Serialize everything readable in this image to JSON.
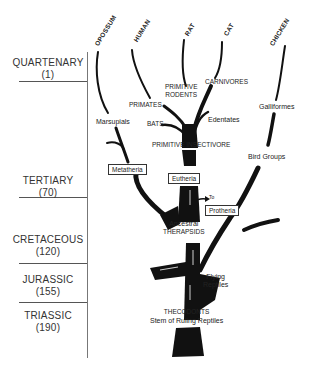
{
  "species": [
    {
      "label": "OPOSSUM"
    },
    {
      "label": "HUMAN"
    },
    {
      "label": "RAT"
    },
    {
      "label": "CAT"
    },
    {
      "label": "CHICKEN"
    }
  ],
  "eras": [
    {
      "name": "QUARTENARY",
      "age": "(1)"
    },
    {
      "name": "TERTIARY",
      "age": "(70)"
    },
    {
      "name": "CRETACEOUS",
      "age": "(120)"
    },
    {
      "name": "JURASSIC",
      "age": "(155)"
    },
    {
      "name": "TRIASSIC",
      "age": "(190)"
    }
  ],
  "labels": {
    "marsupials": "Marsupials",
    "primates": "PRIMATES",
    "primitive_rodents_1": "PRIMITIVE",
    "primitive_rodents_2": "RODENTS",
    "carnivores": "CARNIVORES",
    "bats": "BATS",
    "edentates": "Edentates",
    "galliformes": "Galliformes",
    "primitive_insectivore": "PRIMITIVE INSECTIVORE",
    "bird_groups": "Bird Groups",
    "to": "To",
    "ancestral": "Ancestral",
    "therapsids": "THERAPSIDS",
    "flying": "Flying",
    "reptiles": "Reptiles",
    "thecodonts": "THECODONTS",
    "stem": "Stem of Ruling Reptiles"
  },
  "boxes": {
    "metatheria": "Metatheria",
    "eutheria": "Eutheria",
    "protheria": "Protheria"
  }
}
